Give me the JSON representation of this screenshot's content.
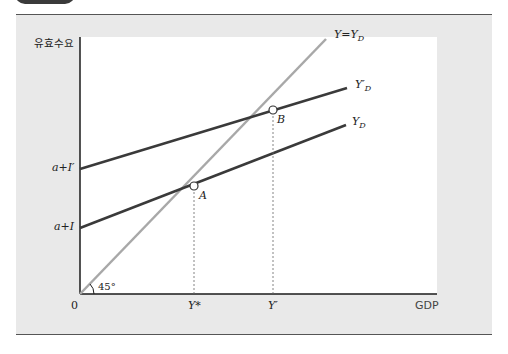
{
  "diagram": {
    "y_axis_label": "유효수요",
    "x_axis_label": "GDP",
    "origin_label": "0",
    "angle_label": "45°",
    "intercepts": [
      {
        "label": "a+I′",
        "id": "a-plus-i-prime"
      },
      {
        "label": "a+I",
        "id": "a-plus-i"
      }
    ],
    "lines": [
      {
        "id": "45-degree",
        "label_main": "Y=Y",
        "label_sub": "D",
        "color": "#a8a8a8"
      },
      {
        "id": "yd-prime",
        "label_main": "Y′",
        "label_sub": "D",
        "color": "#3a3a3a"
      },
      {
        "id": "yd",
        "label_main": "Y",
        "label_sub": "D",
        "color": "#3a3a3a"
      }
    ],
    "points": [
      {
        "id": "A",
        "label": "A"
      },
      {
        "id": "B",
        "label": "B"
      }
    ],
    "x_ticks": [
      {
        "label": "Y*"
      },
      {
        "label": "Y′"
      }
    ]
  }
}
